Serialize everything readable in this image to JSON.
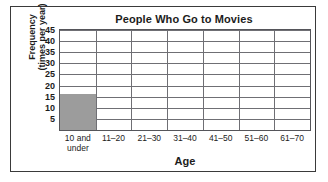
{
  "chart_data": {
    "type": "bar",
    "title": "People Who Go to Movies",
    "xlabel": "Age",
    "ylabel_line1": "Frequency",
    "ylabel_line2": "(times per year)",
    "categories": [
      "10 and under",
      "11–20",
      "21–30",
      "31–40",
      "41–50",
      "51–60",
      "61–70"
    ],
    "category_lines": [
      [
        "10 and",
        "under"
      ],
      [
        "11–20"
      ],
      [
        "21–30"
      ],
      [
        "31–40"
      ],
      [
        "41–50"
      ],
      [
        "51–60"
      ],
      [
        "61–70"
      ]
    ],
    "values": [
      16,
      0,
      0,
      0,
      0,
      0,
      0
    ],
    "ylim": [
      0,
      45
    ],
    "ytick_values": [
      45,
      40,
      35,
      30,
      25,
      20,
      15,
      10,
      5
    ],
    "ytick_labels": [
      "45",
      "40",
      "35",
      "30",
      "25",
      "20",
      "15",
      "10",
      "5"
    ],
    "grid": true,
    "legend": "none",
    "bar_color": "#9c9c9c",
    "grid_color": "#6f6f74",
    "axis_color": "#55555a",
    "text_color": "#1c1c1c",
    "frame_color": "#3a3a3a"
  }
}
